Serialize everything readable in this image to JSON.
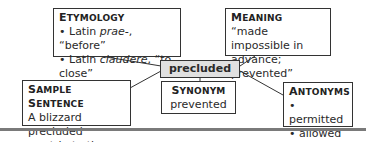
{
  "center_word": "precluded",
  "etymology": {
    "title_cap": "E",
    "title_rest": "TYMOLOGY",
    "items": [
      {
        "prefix": "Latin ",
        "term": "prae-",
        "gloss": ", “before”"
      },
      {
        "prefix": "Latin ",
        "term": "claudere",
        "gloss": ", “to close”"
      }
    ]
  },
  "meaning": {
    "title_cap": "M",
    "title_rest": "EANING",
    "lines": [
      "“made impossible in",
      "advance; prevented”"
    ]
  },
  "sample_sentence": {
    "title_cap1": "S",
    "title_rest1": "AMPLE ",
    "title_cap2": "S",
    "title_rest2": "ENTENCE",
    "lines": [
      "A blizzard precluded",
      "our trip to the beach."
    ]
  },
  "synonym": {
    "title_cap": "S",
    "title_rest": "YNONYM",
    "value": "prevented"
  },
  "antonyms": {
    "title_cap": "A",
    "title_rest": "NTONYMS",
    "items": [
      "permitted",
      "allowed"
    ]
  },
  "bullet": "•"
}
